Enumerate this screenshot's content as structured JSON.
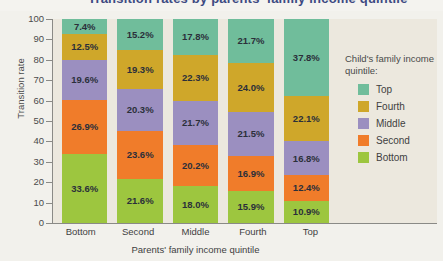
{
  "title": "Transition rates by parents' family income quintile",
  "axis": {
    "ylabel": "Transition rate",
    "xlabel": "Parents' family income quintile",
    "yticks": [
      "100",
      "90",
      "80",
      "70",
      "60",
      "50",
      "40",
      "30",
      "20",
      "10",
      "0"
    ]
  },
  "legend": {
    "heading": "Child's family income quintile:",
    "items": [
      {
        "label": "Top",
        "color": "#70bd9b"
      },
      {
        "label": "Fourth",
        "color": "#cfa72a"
      },
      {
        "label": "Middle",
        "color": "#9b8fc0"
      },
      {
        "label": "Second",
        "color": "#f07c2a"
      },
      {
        "label": "Bottom",
        "color": "#9dc63f"
      }
    ]
  },
  "labels": {
    "b0s0": "7.4%",
    "b0s1": "12.5%",
    "b0s2": "19.6%",
    "b0s3": "26.9%",
    "b0s4": "33.6%",
    "b1s0": "15.2%",
    "b1s1": "19.3%",
    "b1s2": "20.3%",
    "b1s3": "23.6%",
    "b1s4": "21.6%",
    "b2s0": "17.8%",
    "b2s1": "22.3%",
    "b2s2": "21.7%",
    "b2s3": "20.2%",
    "b2s4": "18.0%",
    "b3s0": "21.7%",
    "b3s1": "24.0%",
    "b3s2": "21.5%",
    "b3s3": "16.9%",
    "b3s4": "15.9%",
    "b4s0": "37.8%",
    "b4s1": "22.1%",
    "b4s2": "16.8%",
    "b4s3": "12.4%",
    "b4s4": "10.9%"
  },
  "chart_data": {
    "type": "bar",
    "stacked": true,
    "stack_total": 100,
    "title": "Transition rates by parents' family income quintile",
    "xlabel": "Parents' family income quintile",
    "ylabel": "Transition rate",
    "ylim": [
      0,
      100
    ],
    "ytick_step": 10,
    "grid": false,
    "legend_position": "right",
    "legend_title": "Child's family income quintile:",
    "categories": [
      "Bottom",
      "Second",
      "Middle",
      "Fourth",
      "Top"
    ],
    "series": [
      {
        "name": "Top",
        "color": "#70bd9b",
        "values": [
          7.4,
          15.2,
          17.8,
          21.7,
          37.8
        ]
      },
      {
        "name": "Fourth",
        "color": "#cfa72a",
        "values": [
          12.5,
          19.3,
          22.3,
          24.0,
          22.1
        ]
      },
      {
        "name": "Middle",
        "color": "#9b8fc0",
        "values": [
          19.6,
          20.3,
          21.7,
          21.5,
          16.8
        ]
      },
      {
        "name": "Second",
        "color": "#f07c2a",
        "values": [
          26.9,
          23.6,
          20.2,
          16.9,
          12.4
        ]
      },
      {
        "name": "Bottom",
        "color": "#9dc63f",
        "values": [
          33.6,
          21.6,
          18.0,
          15.9,
          10.9
        ]
      }
    ],
    "stack_order_top_to_bottom": [
      "Top",
      "Fourth",
      "Middle",
      "Second",
      "Bottom"
    ]
  }
}
